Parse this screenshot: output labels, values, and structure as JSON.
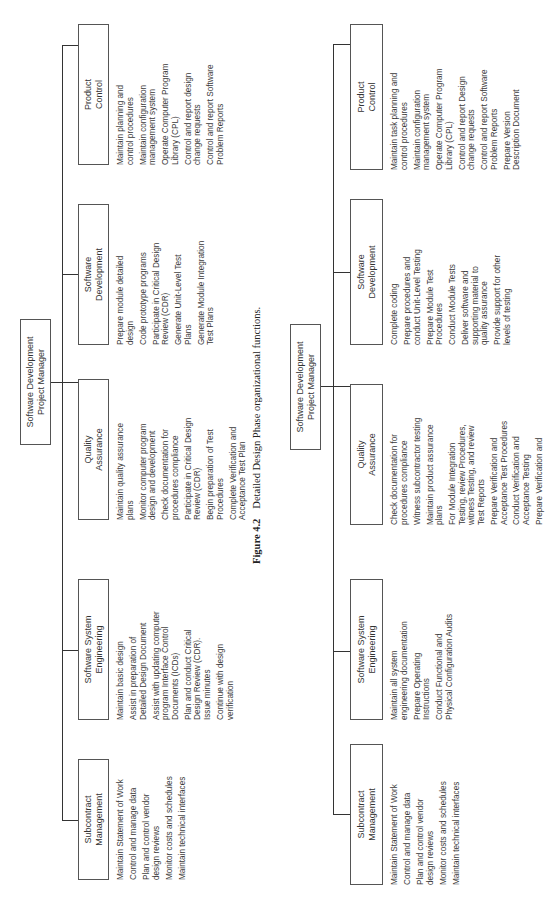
{
  "figure_caption": {
    "number": "Figure 4.2",
    "text": "Detailed Design Phase organizational functions."
  },
  "charts": [
    {
      "name": "detailed-design-phase",
      "manager": "Software Development\nProject Manager",
      "units": [
        {
          "title": "Subcontract\nManagement",
          "items": [
            "Maintain Statement of Work",
            "Control and manage data",
            "Plan and control vendor\ndesign reviews",
            "Monitor costs and schedules",
            "Maintain technical interfaces"
          ]
        },
        {
          "title": "Software System\nEngineering",
          "items": [
            "Maintain basic design",
            "Assist in preparation of\nDetailed Design Document",
            "Assist with updating computer\nprogram Interface Control\nDocuments (ICDs)",
            "Plan and conduct Critical\nDesign Review (CDR).\nIssue minutes",
            "Continue with design\nverification"
          ]
        },
        {
          "title": "Quality\nAssurance",
          "items": [
            "Maintain quality assurance\nplans",
            "Monitor computer program\ndesign and development",
            "Check documentation for\nprocedures compliance",
            "Participate in Critical Design\nReview (CDR)",
            "Begin preparation of Test\nProcedures",
            "Complete Verification and\nAcceptance Test Plan"
          ]
        },
        {
          "title": "Software\nDevelopment",
          "items": [
            "Prepare module detailed\ndesign",
            "Code prototype programs",
            "Participate in Critical Design\nReview (CDR)",
            "Generate Unit-Level Test\nPlans",
            "Generate Module Integration\nTest Plans"
          ]
        },
        {
          "title": "Product\nControl",
          "items": [
            "Maintain planning and\ncontrol procedures",
            "Maintain configuration\nmanagement system",
            "Operate Computer Program\nLibrary (CPL)",
            "Control and report design\nchange requests",
            "Control and report Software\nProblem Reports"
          ]
        }
      ]
    },
    {
      "name": "next-phase",
      "manager": "Software Development\nProject Manager",
      "units": [
        {
          "title": "Subcontract\nManagement",
          "items": [
            "Maintain Statement of Work",
            "Control and manage data",
            "Plan and control vendor\ndesign reviews",
            "Monitor costs and schedules",
            "Maintain technical interfaces"
          ]
        },
        {
          "title": "Software System\nEngineering",
          "items": [
            "Maintain all system\nengineering documentation",
            "Prepare Operating\nInstructions",
            "Conduct Functional and\nPhysical Configuration Audits"
          ]
        },
        {
          "title": "Quality\nAssurance",
          "items": [
            "Check documentation for\nprocedures compliance",
            "Witness subcontractor testing",
            "Maintain product assurance\nplans",
            "For Module Integration\nTesting, review Procedures,\nwitness Testing, and review\nTest Reports",
            "Prepare Verification and\nAcceptance Test Procedures",
            "Conduct Verification and\nAcceptance Testing",
            "Prepare Verification and"
          ]
        },
        {
          "title": "Software\nDevelopment",
          "items": [
            "Complete coding",
            "Prepare procedures and\nconduct Unit-Level Testing",
            "Prepare Module Test\nProcedures",
            "Conduct Module Tests",
            "Deliver software and\nsupporting material to\nquality assurance",
            "Provide support for other\nlevels of testing"
          ]
        },
        {
          "title": "Product\nControl",
          "items": [
            "Maintain task planning and\ncontrol procedures",
            "Maintain configuration\nmanagement system",
            "Operate Computer Program\nLibrary (CPL)",
            "Control and report Design\nchange requests",
            "Control and report Software\nProblem Reports",
            "Prepare Version\nDescription Document"
          ]
        }
      ]
    }
  ]
}
